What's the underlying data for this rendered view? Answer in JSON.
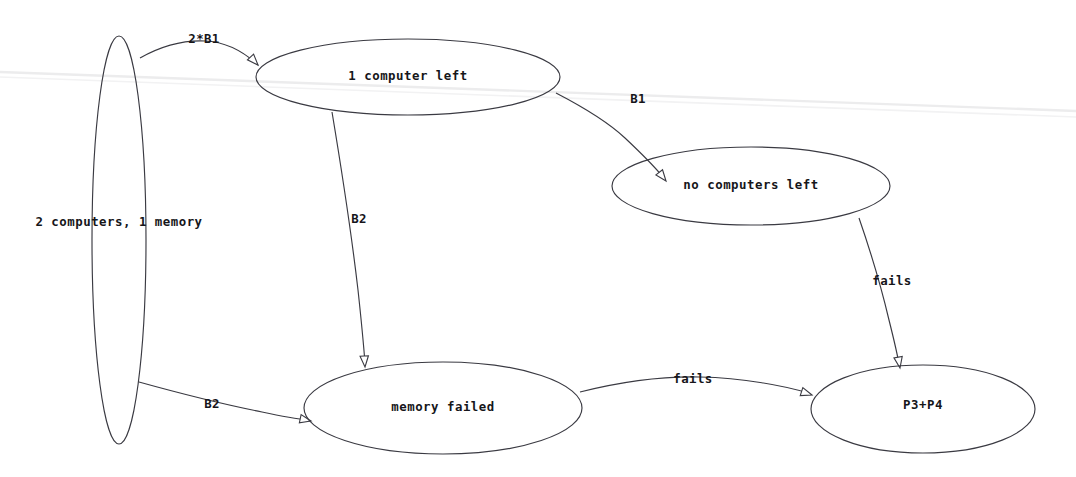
{
  "diagram": {
    "type": "state-transition-graph",
    "title": "",
    "background_color": "#ffffff",
    "stroke_color": "#3a3a42",
    "text_color": "#16161a",
    "canvas": {
      "width": 1076,
      "height": 477
    },
    "nodes": [
      {
        "id": "start",
        "label": "2 computers, 1 memory",
        "shape": "ellipse",
        "cx": 119,
        "cy": 240,
        "rx": 27,
        "ry": 204,
        "label_x": 119,
        "label_y": 222
      },
      {
        "id": "one_computer",
        "label": "1 computer left",
        "shape": "ellipse",
        "cx": 408,
        "cy": 77,
        "rx": 152,
        "ry": 38,
        "label_x": 408,
        "label_y": 76
      },
      {
        "id": "no_computers",
        "label": "no computers left",
        "shape": "ellipse",
        "cx": 751,
        "cy": 186,
        "rx": 139,
        "ry": 39,
        "label_x": 751,
        "label_y": 185
      },
      {
        "id": "memory_failed",
        "label": "memory failed",
        "shape": "ellipse",
        "cx": 443,
        "cy": 408,
        "rx": 139,
        "ry": 46,
        "label_x": 443,
        "label_y": 407
      },
      {
        "id": "p3_p4",
        "label": "P3+P4",
        "shape": "ellipse",
        "cx": 923,
        "cy": 409,
        "rx": 112,
        "ry": 44,
        "label_x": 923,
        "label_y": 405
      }
    ],
    "edges": [
      {
        "id": "start-to-one-computer",
        "from": "start",
        "to": "one_computer",
        "label": "2*B1",
        "label_x": 204,
        "label_y": 39,
        "path": "M 140,58 C 163,45 183,40 205,41 C 228,42 244,52 258,65",
        "arrow_x": 258,
        "arrow_y": 65,
        "arrow_angle": 47
      },
      {
        "id": "start-to-memory-failed",
        "from": "start",
        "to": "memory_failed",
        "label": "B2",
        "label_x": 212,
        "label_y": 404,
        "path": "M 139,382 C 175,392 222,404 262,412 C 280,416 296,419 309,420",
        "arrow_x": 311,
        "arrow_y": 421,
        "arrow_angle": 12
      },
      {
        "id": "one-computer-to-no-computers",
        "from": "one_computer",
        "to": "no_computers",
        "label": "B1",
        "label_x": 638,
        "label_y": 99,
        "path": "M 556,93 C 583,107 608,122 625,138 C 642,154 654,166 663,177",
        "arrow_x": 666,
        "arrow_y": 181,
        "arrow_angle": 52
      },
      {
        "id": "one-computer-to-memory-failed",
        "from": "one_computer",
        "to": "memory_failed",
        "label": "B2",
        "label_x": 359,
        "label_y": 219,
        "path": "M 332,112 C 340,160 351,230 358,290 C 362,327 364,350 365,363",
        "arrow_x": 365,
        "arrow_y": 367,
        "arrow_angle": 86
      },
      {
        "id": "no-computers-to-p3p4",
        "from": "no_computers",
        "to": "p3_p4",
        "label": "fails",
        "label_x": 892,
        "label_y": 281,
        "path": "M 859,218 C 868,244 881,286 889,320 C 895,344 898,358 899,364",
        "arrow_x": 900,
        "arrow_y": 368,
        "arrow_angle": 80
      },
      {
        "id": "memory-failed-to-p3p4",
        "from": "memory_failed",
        "to": "p3_p4",
        "label": "fails",
        "label_x": 693,
        "label_y": 379,
        "path": "M 580,392 C 620,382 660,376 700,377 C 744,378 785,386 808,393",
        "arrow_x": 812,
        "arrow_y": 395,
        "arrow_angle": 18
      }
    ],
    "artifacts": [
      {
        "id": "scan-line-1",
        "path": "M 0,72 L 1076,111"
      },
      {
        "id": "scan-line-2",
        "path": "M 0,77 L 1076,117"
      }
    ]
  }
}
